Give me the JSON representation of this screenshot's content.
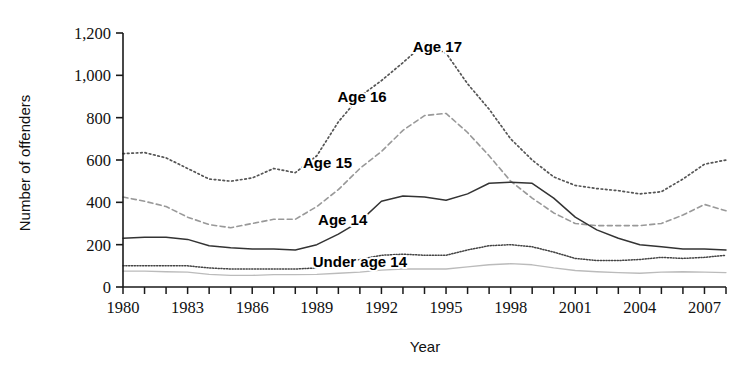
{
  "chart_data": {
    "type": "line",
    "title": "",
    "xlabel": "Year",
    "ylabel": "Number of offenders",
    "xlim": [
      1980,
      2008
    ],
    "ylim": [
      0,
      1200
    ],
    "ytick_step": 200,
    "xtick_step": 1,
    "xtick_label_step": 3,
    "grid": false,
    "legend_position": "inline-annotations",
    "ytick_labels": [
      "0",
      "200",
      "400",
      "600",
      "800",
      "1,000",
      "1,200"
    ],
    "ytick_values": [
      0,
      200,
      400,
      600,
      800,
      1000,
      1200
    ],
    "xtick_labels": [
      "1980",
      "1983",
      "1986",
      "1989",
      "1992",
      "1995",
      "1998",
      "2001",
      "2004",
      "2007"
    ],
    "xtick_values": [
      1980,
      1983,
      1986,
      1989,
      1992,
      1995,
      1998,
      2001,
      2004,
      2007
    ],
    "x": [
      1980,
      1981,
      1982,
      1983,
      1984,
      1985,
      1986,
      1987,
      1988,
      1989,
      1990,
      1991,
      1992,
      1993,
      1994,
      1995,
      1996,
      1997,
      1998,
      1999,
      2000,
      2001,
      2002,
      2003,
      2004,
      2005,
      2006,
      2007,
      2008
    ],
    "series": [
      {
        "name": "Age 17",
        "style": "dotted",
        "color": "#555555",
        "label_x": 1994.6,
        "label_y": 1110,
        "values": [
          630,
          635,
          610,
          560,
          510,
          500,
          515,
          560,
          540,
          620,
          780,
          900,
          975,
          1060,
          1150,
          1105,
          960,
          840,
          700,
          600,
          520,
          480,
          465,
          455,
          440,
          450,
          510,
          580,
          600
        ]
      },
      {
        "name": "Age 16",
        "style": "dashed",
        "color": "#999999",
        "label_x": 1991.1,
        "label_y": 875,
        "values": [
          425,
          405,
          380,
          330,
          295,
          280,
          300,
          320,
          320,
          380,
          460,
          560,
          640,
          740,
          810,
          820,
          730,
          620,
          500,
          420,
          350,
          300,
          290,
          290,
          290,
          300,
          340,
          390,
          360
        ]
      },
      {
        "name": "Age 15",
        "style": "solid",
        "color": "#333333",
        "label_x": 1989.5,
        "label_y": 560,
        "values": [
          230,
          235,
          235,
          225,
          195,
          185,
          180,
          180,
          175,
          200,
          250,
          310,
          405,
          430,
          425,
          410,
          440,
          490,
          495,
          490,
          420,
          330,
          270,
          230,
          200,
          190,
          180,
          180,
          175
        ]
      },
      {
        "name": "Age 14",
        "style": "fine-dotted",
        "color": "#444444",
        "label_x": 1990.2,
        "label_y": 295,
        "values": [
          100,
          100,
          100,
          100,
          90,
          85,
          85,
          85,
          85,
          90,
          110,
          130,
          150,
          155,
          150,
          150,
          175,
          195,
          200,
          190,
          165,
          135,
          125,
          125,
          130,
          140,
          135,
          140,
          150
        ]
      },
      {
        "name": "Under age 14",
        "style": "light-solid",
        "color": "#bbbbbb",
        "label_x": 1991.0,
        "label_y": 95,
        "values": [
          75,
          75,
          72,
          70,
          60,
          55,
          55,
          58,
          58,
          60,
          65,
          70,
          80,
          85,
          85,
          85,
          95,
          105,
          110,
          105,
          90,
          78,
          72,
          68,
          65,
          70,
          72,
          70,
          68
        ]
      }
    ]
  }
}
